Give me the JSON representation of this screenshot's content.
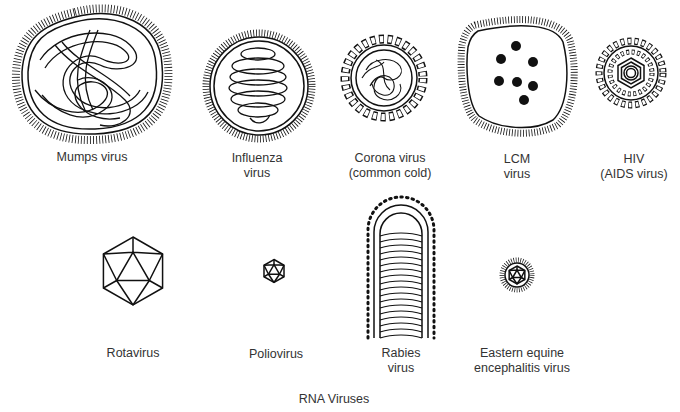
{
  "title": "RNA Viruses",
  "viruses": [
    {
      "name": "Mumps virus",
      "line1": "Mumps virus",
      "line2": ""
    },
    {
      "name": "Influenza virus",
      "line1": "Influenza",
      "line2": "virus"
    },
    {
      "name": "Corona virus (common cold)",
      "line1": "Corona virus",
      "line2": "(common cold)"
    },
    {
      "name": "LCM virus",
      "line1": "LCM",
      "line2": "virus"
    },
    {
      "name": "HIV (AIDS virus)",
      "line1": "HIV",
      "line2": "(AIDS virus)"
    },
    {
      "name": "Rotavirus",
      "line1": "Rotavirus",
      "line2": ""
    },
    {
      "name": "Poliovirus",
      "line1": "Poliovirus",
      "line2": ""
    },
    {
      "name": "Rabies virus",
      "line1": "Rabies",
      "line2": "virus"
    },
    {
      "name": "Eastern equine encephalitis virus",
      "line1": "Eastern equine",
      "line2": "encephalitis virus"
    }
  ]
}
